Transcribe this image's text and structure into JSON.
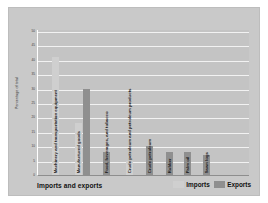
{
  "chart_data": {
    "type": "bar",
    "title": "",
    "xlabel": "Imports and exports",
    "ylabel": "Percentage of total",
    "ylim": [
      0,
      50
    ],
    "yticks": [
      50,
      45,
      40,
      35,
      30,
      25,
      20,
      15,
      10,
      5,
      0
    ],
    "grid": true,
    "legend_position": "bottom-right",
    "legend": [
      "Imports",
      "Exports"
    ],
    "categories": [
      "Machinery and transportation equipment",
      "Manufactured goods",
      "Food, beverages, and tobacco",
      "Crude petroleum and petroleum products",
      "Crude petroleum",
      "Rubber",
      "Palm oil",
      "Sawn logs"
    ],
    "series": [
      {
        "name": "Imports",
        "color": "#cfcfcf",
        "values": [
          41,
          18,
          null,
          5,
          null,
          null,
          null,
          null
        ]
      },
      {
        "name": "Exports",
        "color": "#8f8f8f",
        "values": [
          null,
          30,
          8,
          null,
          10,
          8,
          8,
          7
        ]
      }
    ],
    "bars": [
      {
        "category": "Machinery and transportation equipment",
        "series": "Imports",
        "value": 41,
        "x": 14
      },
      {
        "category": "Manufactured goods",
        "series": "Imports",
        "value": 18,
        "x": 37
      },
      {
        "category": "Manufactured goods",
        "series": "Exports",
        "value": 30,
        "x": 45
      },
      {
        "category": "Food, beverages, and tobacco",
        "series": "Exports",
        "value": 8,
        "x": 65
      },
      {
        "category": "Crude petroleum and petroleum products",
        "series": "Imports",
        "value": 5,
        "x": 88
      },
      {
        "category": "Crude petroleum",
        "series": "Exports",
        "value": 10,
        "x": 108
      },
      {
        "category": "Rubber",
        "series": "Exports",
        "value": 8,
        "x": 128
      },
      {
        "category": "Palm oil",
        "series": "Exports",
        "value": 8,
        "x": 146
      },
      {
        "category": "Sawn logs",
        "series": "Exports",
        "value": 7,
        "x": 165
      }
    ],
    "category_label_x": [
      14,
      37,
      65,
      88,
      108,
      128,
      146,
      165
    ]
  }
}
